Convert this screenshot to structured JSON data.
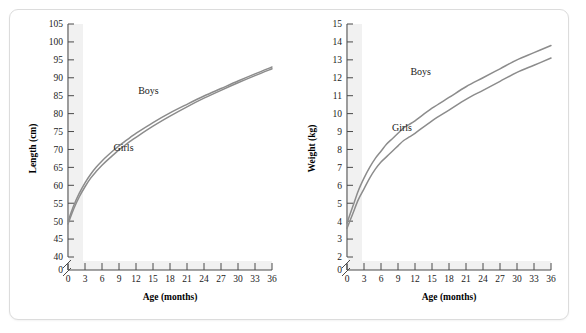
{
  "figure": {
    "background_color": "#ffffff",
    "card_border_color": "#dcdcdc",
    "curve_color": "#8c8c8c",
    "axis_color": "#4a4a4a",
    "band_color": "#f1f1f1"
  },
  "chart_data": [
    {
      "type": "line",
      "title": "",
      "xlabel": "Age (months)",
      "ylabel": "Length (cm)",
      "x": [
        0,
        1,
        2,
        3,
        4,
        5,
        6,
        7,
        8,
        9,
        10,
        11,
        12,
        15,
        18,
        21,
        24,
        27,
        30,
        33,
        36
      ],
      "xlim": [
        0,
        36
      ],
      "ylim": [
        40,
        105
      ],
      "xticks": [
        0,
        3,
        6,
        9,
        12,
        15,
        18,
        21,
        24,
        27,
        30,
        33,
        36
      ],
      "yticks": [
        40,
        45,
        50,
        55,
        60,
        65,
        70,
        75,
        80,
        85,
        90,
        95,
        100,
        105
      ],
      "y_axis_break": true,
      "y_break_label": "0",
      "grid": false,
      "legend": "inline-annotations",
      "series": [
        {
          "name": "Boys",
          "label_x": 14.2,
          "label_y": 85.5,
          "values": [
            50.0,
            54.3,
            57.8,
            60.7,
            63.1,
            65.1,
            66.8,
            68.3,
            69.7,
            71.0,
            72.2,
            73.4,
            74.5,
            77.5,
            80.2,
            82.6,
            84.9,
            87.0,
            89.1,
            91.1,
            93.0
          ]
        },
        {
          "name": "Girls",
          "label_x": 9.8,
          "label_y": 69.5,
          "values": [
            49.2,
            53.4,
            56.8,
            59.6,
            62.0,
            63.9,
            65.6,
            67.1,
            68.5,
            69.9,
            71.1,
            72.3,
            73.4,
            76.5,
            79.3,
            81.9,
            84.3,
            86.5,
            88.6,
            90.6,
            92.5
          ]
        }
      ]
    },
    {
      "type": "line",
      "title": "",
      "xlabel": "Age (months)",
      "ylabel": "Weight (kg)",
      "x": [
        0,
        1,
        2,
        3,
        4,
        5,
        6,
        7,
        8,
        9,
        10,
        11,
        12,
        15,
        18,
        21,
        24,
        27,
        30,
        33,
        36
      ],
      "xlim": [
        0,
        36
      ],
      "ylim": [
        2,
        15
      ],
      "xticks": [
        0,
        3,
        6,
        9,
        12,
        15,
        18,
        21,
        24,
        27,
        30,
        33,
        36
      ],
      "yticks": [
        2,
        3,
        4,
        5,
        6,
        7,
        8,
        9,
        10,
        11,
        12,
        13,
        14,
        15
      ],
      "y_axis_break": true,
      "y_break_label": "0",
      "grid": false,
      "legend": "inline-annotations",
      "series": [
        {
          "name": "Boys",
          "label_x": 13.0,
          "label_y": 12.15,
          "values": [
            3.9,
            4.8,
            5.7,
            6.4,
            7.0,
            7.5,
            7.9,
            8.3,
            8.6,
            8.9,
            9.2,
            9.4,
            9.6,
            10.3,
            10.9,
            11.5,
            12.0,
            12.5,
            13.0,
            13.4,
            13.8
          ]
        },
        {
          "name": "Girls",
          "label_x": 9.7,
          "label_y": 9.05,
          "values": [
            3.6,
            4.4,
            5.2,
            5.8,
            6.4,
            6.9,
            7.3,
            7.6,
            7.9,
            8.2,
            8.5,
            8.7,
            8.9,
            9.6,
            10.2,
            10.8,
            11.3,
            11.8,
            12.3,
            12.7,
            13.1
          ]
        }
      ]
    }
  ]
}
